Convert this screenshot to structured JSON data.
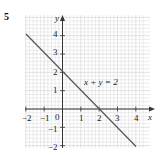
{
  "question_number": "5",
  "graph": {
    "x_axis_label": "x",
    "y_axis_label": "y",
    "x_ticks": [
      "−2",
      "−1",
      "0",
      "1",
      "2",
      "3",
      "4"
    ],
    "y_ticks": [
      "4",
      "3",
      "2",
      "1",
      "−1",
      "−2"
    ],
    "line_label": "x + y = 2",
    "line_color": "#555555",
    "grid_color": "#d8d8d8"
  },
  "chart_data": {
    "type": "line",
    "title": "",
    "xlabel": "x",
    "ylabel": "y",
    "xlim": [
      -2,
      4
    ],
    "ylim": [
      -2,
      4.5
    ],
    "grid": true,
    "series": [
      {
        "name": "x + y = 2",
        "x": [
          -2,
          4
        ],
        "y": [
          4,
          -2
        ]
      }
    ],
    "annotations": [
      "x + y = 2"
    ]
  }
}
